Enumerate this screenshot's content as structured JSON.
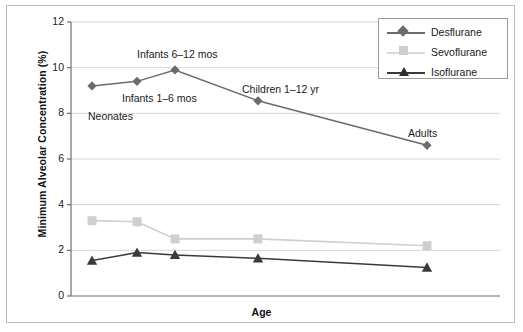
{
  "chart_data": {
    "type": "line",
    "title": "",
    "xlabel": "Age",
    "ylabel": "Minimum Alveolar Concentration (%)",
    "ylim": [
      0,
      12
    ],
    "yticks": [
      0,
      2,
      4,
      6,
      8,
      10,
      12
    ],
    "grid": true,
    "legend_position": "top-right",
    "categories": [
      "Neonates",
      "Infants 1–6 mos",
      "Infants 6–12 mos",
      "Children 1–12 yr",
      "Adults"
    ],
    "series": [
      {
        "name": "Desflurane",
        "marker": "diamond",
        "color": "#6b6b6b",
        "values": [
          9.2,
          9.4,
          9.9,
          8.55,
          6.6
        ]
      },
      {
        "name": "Sevoflurane",
        "marker": "square",
        "color": "#cfcfcf",
        "values": [
          3.3,
          3.25,
          2.5,
          2.5,
          2.2
        ]
      },
      {
        "name": "Isoflurane",
        "marker": "triangle",
        "color": "#3a3a3a",
        "values": [
          1.55,
          1.9,
          1.8,
          1.65,
          1.25
        ]
      }
    ],
    "annotations": [
      {
        "text": "Neonates",
        "x": 88,
        "y": 110
      },
      {
        "text": "Infants 1–6 mos",
        "x": 122,
        "y": 92
      },
      {
        "text": "Infants 6–12 mos",
        "x": 137,
        "y": 48
      },
      {
        "text": "Children  1–12 yr",
        "x": 242,
        "y": 83
      },
      {
        "text": "Adults",
        "x": 408,
        "y": 127
      }
    ]
  },
  "legend": {
    "items": [
      {
        "label": "Desflurane"
      },
      {
        "label": "Sevoflurane"
      },
      {
        "label": "Isoflurane"
      }
    ]
  },
  "axis": {
    "y_tick_labels": [
      "12",
      "10",
      "8",
      "6",
      "4",
      "2",
      "0"
    ]
  }
}
